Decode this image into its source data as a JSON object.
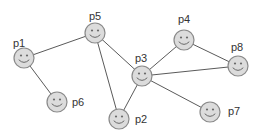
{
  "diagram": {
    "type": "network-graph",
    "nodes": [
      {
        "id": "p1",
        "label": "p1",
        "x": 24,
        "y": 58,
        "lx": 19,
        "ly": 47
      },
      {
        "id": "p5",
        "label": "p5",
        "x": 95,
        "y": 33,
        "lx": 95,
        "ly": 20
      },
      {
        "id": "p6",
        "label": "p6",
        "x": 57,
        "y": 102,
        "lx": 78,
        "ly": 106
      },
      {
        "id": "p2",
        "label": "p2",
        "x": 119,
        "y": 119,
        "lx": 141,
        "ly": 123
      },
      {
        "id": "p3",
        "label": "p3",
        "x": 142,
        "y": 76,
        "lx": 141,
        "ly": 62
      },
      {
        "id": "p4",
        "label": "p4",
        "x": 184,
        "y": 40,
        "lx": 184,
        "ly": 23
      },
      {
        "id": "p8",
        "label": "p8",
        "x": 238,
        "y": 66,
        "lx": 237,
        "ly": 51
      },
      {
        "id": "p7",
        "label": "p7",
        "x": 210,
        "y": 112,
        "lx": 234,
        "ly": 115
      }
    ],
    "edges": [
      [
        "p1",
        "p5"
      ],
      [
        "p1",
        "p6"
      ],
      [
        "p5",
        "p2"
      ],
      [
        "p5",
        "p3"
      ],
      [
        "p3",
        "p2"
      ],
      [
        "p3",
        "p4"
      ],
      [
        "p3",
        "p8"
      ],
      [
        "p3",
        "p7"
      ],
      [
        "p4",
        "p8"
      ]
    ],
    "colors": {
      "node_fill": "#dcdcdc",
      "node_stroke": "#8a8a8a",
      "edge": "#5a5a5a",
      "label": "#333333"
    }
  }
}
